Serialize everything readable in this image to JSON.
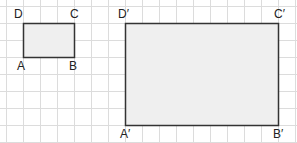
{
  "diagram": {
    "grid": {
      "cell_size": 17,
      "origin_x": 6,
      "origin_y": 6,
      "cols": 17,
      "rows": 8,
      "line_color": "#dcdcdc"
    },
    "shapes": [
      {
        "name": "rectangle-ABCD",
        "fill": "#efefef",
        "stroke": "#333333",
        "x": 23,
        "y": 23,
        "width": 51,
        "height": 34,
        "grid_width": 3,
        "grid_height": 2,
        "vertices": {
          "A": {
            "label": "A",
            "x": 23,
            "y": 57
          },
          "B": {
            "label": "B",
            "x": 74,
            "y": 57
          },
          "C": {
            "label": "C",
            "x": 74,
            "y": 23
          },
          "D": {
            "label": "D",
            "x": 23,
            "y": 23
          }
        }
      },
      {
        "name": "rectangle-A'B'C'D'",
        "fill": "#efefef",
        "stroke": "#333333",
        "x": 125,
        "y": 23,
        "width": 153,
        "height": 102,
        "grid_width": 9,
        "grid_height": 6,
        "vertices": {
          "A": {
            "label": "A′",
            "x": 125,
            "y": 125
          },
          "B": {
            "label": "B′",
            "x": 278,
            "y": 125
          },
          "C": {
            "label": "C′",
            "x": 278,
            "y": 23
          },
          "D": {
            "label": "D′",
            "x": 125,
            "y": 23
          }
        }
      }
    ]
  }
}
